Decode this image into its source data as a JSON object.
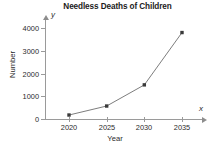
{
  "chart_data": {
    "type": "line",
    "title": "Needless Deaths of Children",
    "xlabel": "Year",
    "ylabel": "Number",
    "x_axis_letter": "x",
    "y_axis_letter": "y",
    "categories": [
      "2020",
      "2025",
      "2030",
      "2035"
    ],
    "x": [
      2020,
      2025,
      2030,
      2035
    ],
    "values": [
      175,
      570,
      1500,
      3800
    ],
    "series": [
      {
        "name": "Needless deaths",
        "values": [
          175,
          570,
          1500,
          3800
        ]
      }
    ],
    "xlim": [
      2018,
      2037
    ],
    "ylim": [
      0,
      4400
    ],
    "ytick_labels": [
      "0",
      "1000",
      "2000",
      "3000",
      "4000"
    ],
    "ytick_values": [
      0,
      1000,
      2000,
      3000,
      4000
    ],
    "xtick_labels": [
      "2020",
      "2025",
      "2030",
      "2035"
    ],
    "xtick_values": [
      2020,
      2025,
      2030,
      2035
    ],
    "grid": false,
    "legend": "none",
    "marker": "square",
    "line_color": "#6e6e6e",
    "marker_color": "#3a3a3a",
    "axis_color": "#9a9a9a",
    "text_color": "#2b2b2b",
    "background_color": "#ffffff"
  }
}
